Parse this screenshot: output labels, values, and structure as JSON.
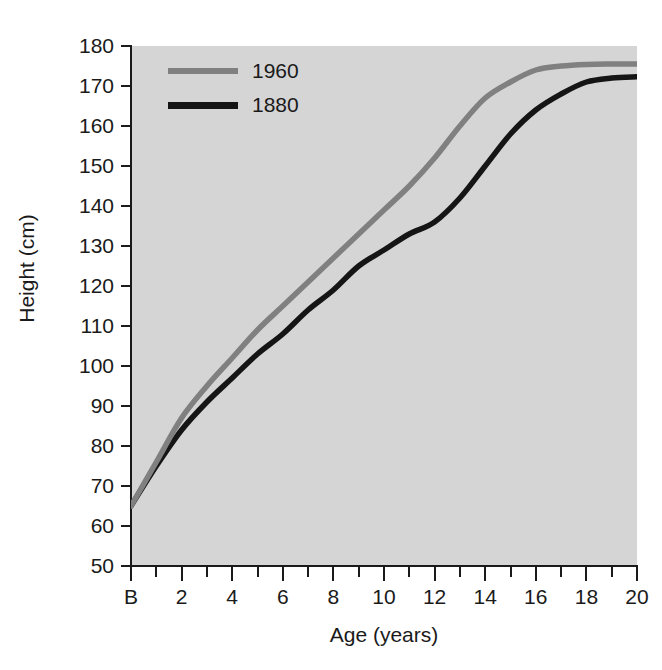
{
  "chart_data": {
    "type": "line",
    "title": "",
    "xlabel": "Age (years)",
    "ylabel": "Height (cm)",
    "xlim": [
      0,
      20
    ],
    "ylim": [
      50,
      180
    ],
    "grid": false,
    "legend_position": "top-left",
    "background_color": "#d5d5d5",
    "x_tick_labels": [
      "B",
      "2",
      "4",
      "6",
      "8",
      "10",
      "12",
      "14",
      "16",
      "18",
      "20"
    ],
    "x_tick_values": [
      0,
      2,
      4,
      6,
      8,
      10,
      12,
      14,
      16,
      18,
      20
    ],
    "x_minor_tick_values": [
      1,
      3,
      5,
      7,
      9,
      11,
      13,
      15,
      17,
      19
    ],
    "y_tick_labels": [
      "50",
      "60",
      "70",
      "80",
      "90",
      "100",
      "110",
      "120",
      "130",
      "140",
      "150",
      "160",
      "170",
      "180"
    ],
    "y_tick_values": [
      50,
      60,
      70,
      80,
      90,
      100,
      110,
      120,
      130,
      140,
      150,
      160,
      170,
      180
    ],
    "x": [
      0,
      1,
      2,
      3,
      4,
      5,
      6,
      7,
      8,
      9,
      10,
      11,
      12,
      13,
      14,
      15,
      16,
      17,
      18,
      19,
      20
    ],
    "series": [
      {
        "name": "1960",
        "color": "#808080",
        "values": [
          65,
          76,
          87,
          95,
          102,
          109,
          115,
          121,
          127,
          133,
          139,
          145,
          152,
          160,
          167,
          171,
          174,
          175,
          175.4,
          175.5,
          175.5
        ]
      },
      {
        "name": "1880",
        "color": "#151515",
        "values": [
          65,
          75,
          84,
          91,
          97,
          103,
          108,
          114,
          119,
          125,
          129,
          133,
          136,
          142,
          150,
          158,
          164,
          168,
          171,
          172,
          172.3
        ]
      }
    ]
  },
  "legend": {
    "entries": [
      {
        "label": "1960",
        "color": "#808080"
      },
      {
        "label": "1880",
        "color": "#151515"
      }
    ]
  },
  "axes": {
    "y_title": "Height (cm)",
    "x_title": "Age (years)"
  }
}
